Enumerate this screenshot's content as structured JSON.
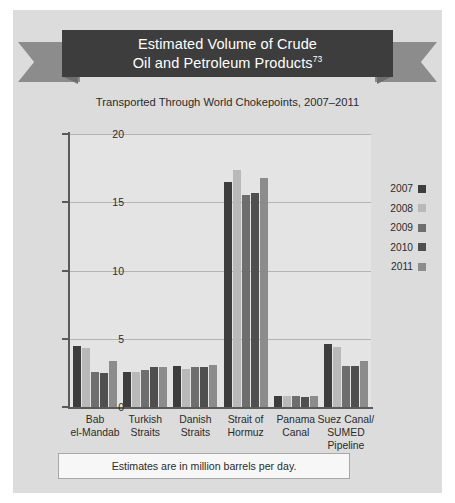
{
  "figure": {
    "background_color": "#dcdcdc",
    "banner_color": "#3d3d3d",
    "ribbon_tail_color": "#8c8c8c"
  },
  "banner": {
    "title_line1": "Estimated Volume of Crude",
    "title_line2": "Oil and Petroleum Products",
    "footnote_marker": "73"
  },
  "subtitle": "Transported Through World Chokepoints, 2007–2011",
  "footnote": "Estimates are in million barrels per day.",
  "legend": {
    "entries": [
      {
        "label": "2007",
        "color": "#3d3d3d"
      },
      {
        "label": "2008",
        "color": "#b9b9b9"
      },
      {
        "label": "2009",
        "color": "#6e6e6e"
      },
      {
        "label": "2010",
        "color": "#4f4f4f"
      },
      {
        "label": "2011",
        "color": "#8c8c8c"
      }
    ]
  },
  "chart_data": {
    "type": "bar",
    "title": "Estimated Volume of Crude Oil and Petroleum Products",
    "subtitle": "Transported Through World Chokepoints, 2007–2011",
    "xlabel": "",
    "ylabel": "",
    "ylim": [
      0,
      20
    ],
    "yticks": [
      0,
      5,
      10,
      15,
      20
    ],
    "grid": true,
    "legend_position": "right",
    "units": "million barrels per day",
    "categories": [
      "Bab el-Mandab",
      "Turkish Straits",
      "Danish Straits",
      "Strait of Hormuz",
      "Panama Canal",
      "Suez Canal/ SUMED Pipeline"
    ],
    "category_lines": [
      [
        "Bab",
        "el-Mandab"
      ],
      [
        "Turkish",
        "Straits"
      ],
      [
        "Danish",
        "Straits"
      ],
      [
        "Strait of",
        "Hormuz"
      ],
      [
        "Panama",
        "Canal"
      ],
      [
        "Suez Canal/",
        "SUMED",
        "Pipeline"
      ]
    ],
    "series": [
      {
        "name": "2007",
        "color": "#3d3d3d",
        "values": [
          4.5,
          2.6,
          3.0,
          16.5,
          0.8,
          4.6
        ]
      },
      {
        "name": "2008",
        "color": "#b9b9b9",
        "values": [
          4.3,
          2.6,
          2.8,
          17.4,
          0.8,
          4.4
        ]
      },
      {
        "name": "2009",
        "color": "#6e6e6e",
        "values": [
          2.6,
          2.7,
          2.9,
          15.5,
          0.8,
          3.0
        ]
      },
      {
        "name": "2010",
        "color": "#4f4f4f",
        "values": [
          2.5,
          2.9,
          2.9,
          15.7,
          0.7,
          3.0
        ]
      },
      {
        "name": "2011",
        "color": "#8c8c8c",
        "values": [
          3.4,
          2.9,
          3.1,
          16.8,
          0.8,
          3.4
        ]
      }
    ]
  }
}
